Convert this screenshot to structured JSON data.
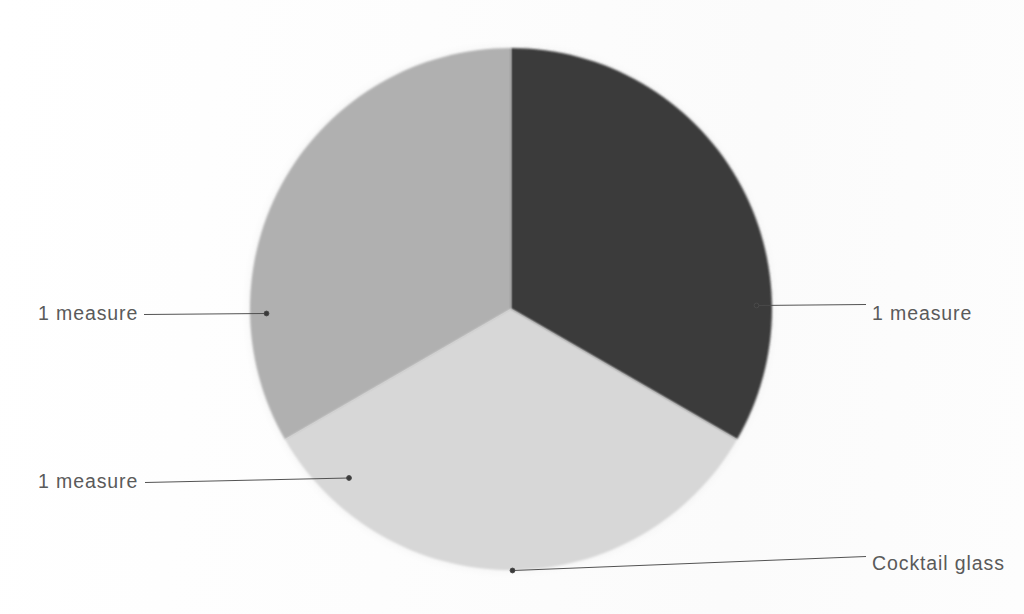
{
  "figure": {
    "background_color": "#fefefe"
  },
  "chart_data": {
    "type": "pie",
    "title": "",
    "subtitle": "",
    "xlabel": "",
    "ylabel": "",
    "grid": false,
    "legend_position": "callout-labels",
    "center": {
      "x": 511,
      "y": 309
    },
    "radius": 261,
    "halo_radius": 271,
    "halo_color": "#ececec",
    "labels": [
      "1 measure",
      "1 measure",
      "1 measure"
    ],
    "values": [
      1,
      1,
      1
    ],
    "percentages": [
      33.3,
      33.3,
      33.3
    ],
    "colors": [
      "#3b3b3b",
      "#d7d7d7",
      "#b0b0b0"
    ],
    "slices": [
      {
        "name": "slice-dark-upper-right",
        "label": "1 measure",
        "value": 1,
        "percent": 33.3,
        "color": "#3b3b3b",
        "start_angle_deg": 0,
        "end_angle_deg": 120,
        "callout_side": "right"
      },
      {
        "name": "slice-light-bottom",
        "label": "1 measure",
        "value": 1,
        "percent": 33.3,
        "color": "#d7d7d7",
        "start_angle_deg": 120,
        "end_angle_deg": 240,
        "callout_side": "left-lower"
      },
      {
        "name": "slice-mid-upper-left",
        "label": "1 measure",
        "value": 1,
        "percent": 33.3,
        "color": "#b0b0b0",
        "start_angle_deg": 240,
        "end_angle_deg": 360,
        "callout_side": "left-middle"
      }
    ],
    "outer_label": {
      "name": "cocktail-glass",
      "text": "Cocktail glass",
      "points_to": "pie-outline-bottom"
    },
    "annotations": [
      {
        "text": "1 measure",
        "position": "left-middle"
      },
      {
        "text": "1 measure",
        "position": "right-middle"
      },
      {
        "text": "1 measure",
        "position": "left-lower"
      },
      {
        "text": "Cocktail glass",
        "position": "bottom-right"
      }
    ]
  },
  "callouts": {
    "left_middle": {
      "text": "1 measure"
    },
    "right_middle": {
      "text": "1 measure"
    },
    "left_lower": {
      "text": "1 measure"
    },
    "bottom_right": {
      "text": "Cocktail glass"
    }
  },
  "colors": {
    "slice_dark": "#3b3b3b",
    "slice_light": "#d7d7d7",
    "slice_mid": "#b0b0b0",
    "halo": "#ececec",
    "leader_line": "#4a4a4a",
    "label_text": "#5a5a5a",
    "background": "#fefefe"
  }
}
